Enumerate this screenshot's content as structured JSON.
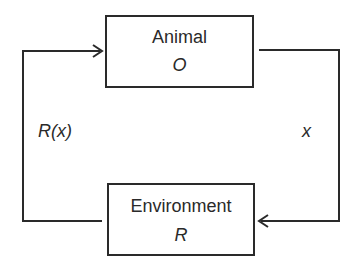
{
  "diagram": {
    "nodes": [
      {
        "id": "animal",
        "title": "Animal",
        "symbol": "O"
      },
      {
        "id": "environment",
        "title": "Environment",
        "symbol": "R"
      }
    ],
    "edges": [
      {
        "from": "animal",
        "to": "environment",
        "label": "x"
      },
      {
        "from": "environment",
        "to": "animal",
        "label": "R(x)"
      }
    ],
    "colors": {
      "stroke": "#2a2a2a",
      "background": "#ffffff"
    }
  }
}
